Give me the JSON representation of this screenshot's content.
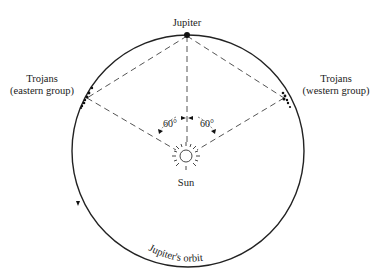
{
  "diagram": {
    "labels": {
      "jupiter": "Jupiter",
      "trojans_east_line1": "Trojans",
      "trojans_east_line2": "(eastern group)",
      "trojans_west_line1": "Trojans",
      "trojans_west_line2": "(western group)",
      "sun": "Sun",
      "angle_left": "60°",
      "angle_right": "60°",
      "orbit": "Jupiter's orbit"
    },
    "geometry": {
      "orbit_center": [
        188,
        151
      ],
      "orbit_radius": 116,
      "jupiter_position": [
        187,
        35
      ],
      "sun_position": [
        186,
        156
      ],
      "trojans_east_point": [
        87,
        98
      ],
      "trojans_west_point": [
        284,
        98
      ]
    },
    "colors": {
      "line": "#222222",
      "dash": "#555555",
      "background": "#ffffff"
    }
  }
}
